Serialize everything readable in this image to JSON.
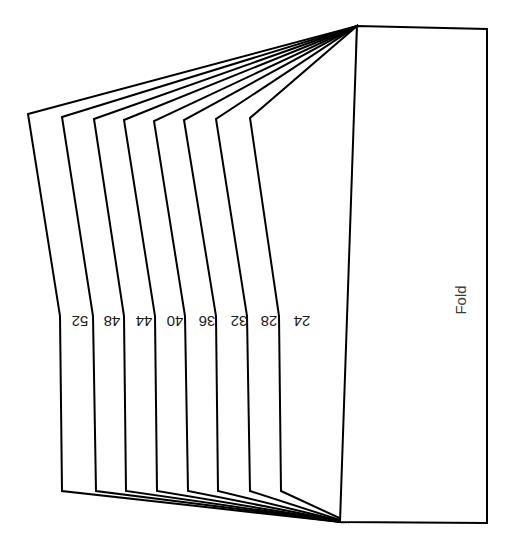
{
  "canvas": {
    "width": 513,
    "height": 542,
    "background": "#ffffff",
    "stroke_color": "#000000",
    "stroke_width": 2
  },
  "diagram": {
    "title": "",
    "type": "folded-signature-line-art",
    "fold_panel": {
      "label": "Fold",
      "label_rotation_deg": -90,
      "label_x": 462,
      "label_y": 300
    },
    "leaf_labels": [
      {
        "text": "52",
        "x": 80,
        "y": 320,
        "rotation_deg": 180
      },
      {
        "text": "48",
        "x": 112,
        "y": 320,
        "rotation_deg": 180
      },
      {
        "text": "44",
        "x": 144,
        "y": 320,
        "rotation_deg": 180
      },
      {
        "text": "40",
        "x": 175,
        "y": 320,
        "rotation_deg": 180
      },
      {
        "text": "36",
        "x": 207,
        "y": 320,
        "rotation_deg": 180
      },
      {
        "text": "32",
        "x": 239,
        "y": 320,
        "rotation_deg": 180
      },
      {
        "text": "28",
        "x": 269,
        "y": 320,
        "rotation_deg": 180
      },
      {
        "text": "24",
        "x": 302,
        "y": 320,
        "rotation_deg": 180
      }
    ],
    "leaves": [
      {
        "name": "leaf-52",
        "points": "28,114 60,316 62,491 340,522 357,26"
      },
      {
        "name": "leaf-48",
        "points": "62,117 93,316 96,491 341,522 357,26"
      },
      {
        "name": "leaf-44",
        "points": "94,119 124,316 126,491 342,522 357,26"
      },
      {
        "name": "leaf-40",
        "points": "124,120 155,316 157,491 343,522 357,26"
      },
      {
        "name": "leaf-36",
        "points": "154,121 185,316 188,491 344,522 357,26"
      },
      {
        "name": "leaf-32",
        "points": "184,120 216,316 218,491 345,522 357,26"
      },
      {
        "name": "leaf-28",
        "points": "216,119 247,316 250,491 346,522 357,26"
      },
      {
        "name": "leaf-24",
        "points": "250,118 279,316 281,491 348,522 357,26"
      }
    ],
    "fold_panel_shape": {
      "name": "fold-panel",
      "points": "357,26 487,29 487,523 340,522"
    }
  }
}
